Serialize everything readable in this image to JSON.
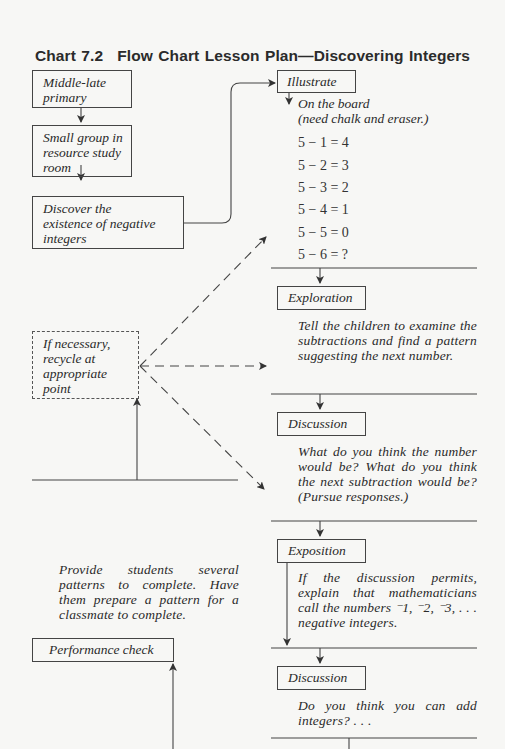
{
  "chart_title": {
    "number": "Chart 7.2",
    "text": "Flow Chart Lesson Plan—Discovering Integers"
  },
  "left_column": {
    "boxes": [
      {
        "lines": [
          "Middle-late",
          "primary"
        ]
      },
      {
        "lines": [
          "Small group in",
          "resource study",
          "room"
        ]
      },
      {
        "lines": [
          "Discover the",
          "existence of negative",
          "integers"
        ]
      }
    ],
    "recycle_box": {
      "lines": [
        "If necessary,",
        "recycle at",
        "appropriate",
        "point"
      ]
    },
    "practice_note": "Provide students several patterns to complete. Have them prepare a pattern for a classmate to complete.",
    "performance_box": "Performance check"
  },
  "right_column": {
    "illustrate": {
      "label": "Illustrate",
      "note_line1": "On the board",
      "note_line2": "(need chalk and eraser.)",
      "equations": [
        "5 − 1 = 4",
        "5 − 2 = 3",
        "5 − 3 = 2",
        "5 − 4 = 1",
        "5 − 5 = 0",
        "5 − 6 = ?"
      ]
    },
    "exploration": {
      "label": "Exploration",
      "text": "Tell the children to examine the subtractions and find a pattern suggesting the next number."
    },
    "discussion1": {
      "label": "Discussion",
      "text": "What do you think the number would be? What do you think the next subtraction would be? (Pursue responses.)"
    },
    "exposition": {
      "label": "Exposition",
      "text": "If the discussion permits, explain that mathematicians call the numbers ⁻1, ⁻2, ⁻3, . . . negative integers."
    },
    "discussion2": {
      "label": "Discussion",
      "text": "Do you think you can add integers? . . ."
    }
  }
}
